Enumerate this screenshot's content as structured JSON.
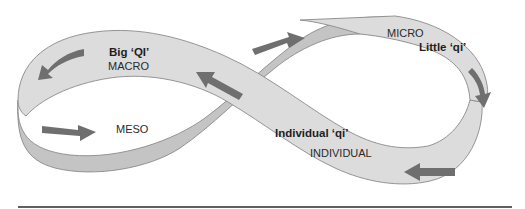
{
  "diagram": {
    "type": "mobius-strip-cycle",
    "labels": {
      "big_qi": "Big ‘QI’",
      "macro": "MACRO",
      "micro": "MICRO",
      "little_qi": "Little ‘qi’",
      "meso": "MESO",
      "individual_qi": "Individual ‘qi’",
      "individual": "INDIVIDUAL"
    },
    "arrows": [
      {
        "id": "macro-arrow",
        "direction": "left-down"
      },
      {
        "id": "center-up-arrow",
        "direction": "up-left"
      },
      {
        "id": "center-right-arrow",
        "direction": "up-right"
      },
      {
        "id": "micro-arrow",
        "direction": "down"
      },
      {
        "id": "individual-arrow",
        "direction": "left"
      },
      {
        "id": "meso-arrow",
        "direction": "right"
      }
    ],
    "colors": {
      "band_light": "#dcdcdc",
      "band_dark": "#c4c4c4",
      "arrow": "#6f6f6f",
      "outline": "#8a8a8a",
      "rule": "#2b2b2b"
    }
  }
}
